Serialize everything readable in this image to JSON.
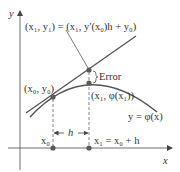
{
  "colors": {
    "axis": "#6e6e6e",
    "curve": "#555555",
    "dot": "#5a5a5a",
    "text": "#333333"
  },
  "axes": {
    "x_label": "x",
    "y_label": "y"
  },
  "labels": {
    "euler_point": "(x₁, y₁) = (x₁, y′(x₀)h + y₀)",
    "euler_point_parts": {
      "lhs_open": "(",
      "x1": "x",
      "x1_sub": "1",
      "comma1": ", ",
      "y1": "y",
      "y1_sub": "1",
      "eq": ") = (",
      "x1b": "x",
      "x1b_sub": "1",
      "comma2": ", ",
      "yprime": "y′(",
      "x0": "x",
      "x0_sub": "0",
      "close_h": ")h + ",
      "y0": "y",
      "y0_sub": "0",
      "close": ")"
    },
    "error": "Error",
    "start_point": "(x₀, y₀)",
    "true_point": "(x₁, φ(x₁))",
    "curve": "y = φ(x)",
    "step": "h",
    "x0_tick": "x₀",
    "x1_tick": "x₁ = x₀ + h"
  }
}
